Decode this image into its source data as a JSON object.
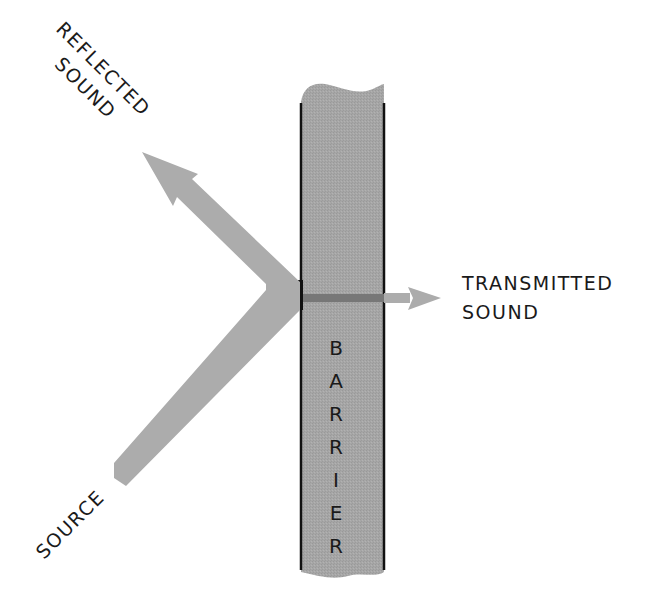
{
  "diagram": {
    "type": "sound-barrier-schematic",
    "labels": {
      "reflected_line1": "REFLECTED",
      "reflected_line2": "SOUND",
      "transmitted_line1": "TRANSMITTED",
      "transmitted_line2": "SOUND",
      "source": "SOURCE",
      "barrier_letters": [
        "B",
        "A",
        "R",
        "R",
        "I",
        "E",
        "R"
      ]
    },
    "colors": {
      "arrow_fill": "#acacac",
      "barrier_fill": "#a4a4a4",
      "barrier_edge": "#111111",
      "transmission_band": "#777777",
      "text": "#1a1a1a",
      "background": "#ffffff"
    },
    "nodes": [
      {
        "id": "source",
        "label": "SOURCE"
      },
      {
        "id": "barrier",
        "label": "BARRIER"
      },
      {
        "id": "reflected",
        "label": "REFLECTED SOUND"
      },
      {
        "id": "transmitted",
        "label": "TRANSMITTED SOUND"
      }
    ],
    "edges": [
      {
        "from": "source",
        "to": "barrier",
        "kind": "incident sound"
      },
      {
        "from": "barrier",
        "to": "reflected",
        "kind": "reflection"
      },
      {
        "from": "barrier",
        "to": "transmitted",
        "kind": "transmission"
      }
    ]
  }
}
